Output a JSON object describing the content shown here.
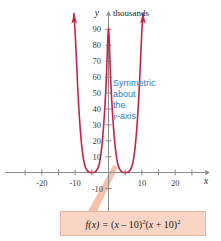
{
  "figure": {
    "name": "polynomial-graph",
    "colors": {
      "curve": "#cc2144",
      "axis": "#8a8a8a",
      "note": "#2a7fc9",
      "callout_fill": "#f9d5c5",
      "callout_border": "#e8a98c",
      "leader": "#f6c0aa",
      "background": "#ffffff"
    },
    "y_axis": {
      "unit_label": "thousands",
      "name": "y",
      "ticks": [
        {
          "value": 90,
          "label": "90"
        },
        {
          "value": 80,
          "label": "80"
        },
        {
          "value": 70,
          "label": "70"
        },
        {
          "value": 60,
          "label": "60"
        },
        {
          "value": 50,
          "label": "50"
        },
        {
          "value": 40,
          "label": "40"
        },
        {
          "value": 30,
          "label": "30"
        },
        {
          "value": 20,
          "label": "20"
        },
        {
          "value": 10,
          "label": "10"
        },
        {
          "value": -10,
          "label": "-10"
        }
      ]
    },
    "x_axis": {
      "name": "x",
      "ticks": [
        {
          "value": -25,
          "label": ""
        },
        {
          "value": -20,
          "label": "-20"
        },
        {
          "value": -15,
          "label": ""
        },
        {
          "value": -10,
          "label": "-10"
        },
        {
          "value": -5,
          "label": ""
        },
        {
          "value": 5,
          "label": ""
        },
        {
          "value": 10,
          "label": "10"
        },
        {
          "value": 15,
          "label": ""
        },
        {
          "value": 20,
          "label": "20"
        },
        {
          "value": 25,
          "label": ""
        }
      ]
    },
    "annotation": {
      "lines": [
        "Symmetric",
        "about",
        "the"
      ],
      "last_line_italic": "y",
      "last_line_rest": "-axis"
    },
    "callout": {
      "fn_name": "f",
      "fn_arg": "(x)",
      "equals": "=",
      "factor1_open": "(",
      "factor1_var": "x",
      "factor1_op": " – 10)",
      "factor1_exp": "2",
      "factor2_open": "(",
      "factor2_var": "x",
      "factor2_op": " + 10)",
      "factor2_exp": "2",
      "full_text": "f(x) = (x – 10)2(x + 10)2"
    }
  },
  "chart_data": {
    "type": "line",
    "title": "",
    "xlabel": "x",
    "ylabel": "y",
    "y_unit": "thousands",
    "equation": "f(x) = (x - 10)^2 (x + 10)^2",
    "xlim": [
      -27,
      27
    ],
    "ylim": [
      -15,
      100
    ],
    "grid": false,
    "legend": null,
    "xticks": [
      -20,
      -10,
      10,
      20
    ],
    "yticks": [
      -10,
      10,
      20,
      30,
      40,
      50,
      60,
      70,
      80,
      90
    ],
    "roots": [
      -10,
      10
    ],
    "local_maximum": {
      "x": 0,
      "y": 10
    },
    "annotations": [
      {
        "text": "Symmetric about the y-axis",
        "x": 3,
        "y": 50
      },
      {
        "text": "f(x) = (x - 10)^2(x + 10)^2",
        "x": 8,
        "y": -30
      }
    ],
    "series": [
      {
        "name": "f(x) = (x-10)^2(x+10)^2",
        "x": [
          -20.8,
          -20,
          -19,
          -18,
          -17,
          -16,
          -15,
          -14,
          -13,
          -12,
          -11,
          -10,
          -9,
          -8,
          -7,
          -6,
          -5,
          -4,
          -3,
          -2,
          -1,
          0,
          1,
          2,
          3,
          4,
          5,
          6,
          7,
          8,
          9,
          10,
          11,
          12,
          13,
          14,
          15,
          16,
          17,
          18,
          19,
          20,
          20.8
        ],
        "y": [
          100,
          90.0,
          64.9,
          43.7,
          27.7,
          15.9,
          7.81,
          3.46,
          1.32,
          0.38,
          0.07,
          0,
          0.07,
          0.38,
          1.32,
          3.46,
          7.81,
          15.9,
          27.7,
          43.7,
          64.9,
          100,
          64.9,
          43.7,
          27.7,
          15.9,
          7.81,
          3.46,
          1.32,
          0.38,
          0.07,
          0,
          0.07,
          0.38,
          1.32,
          3.46,
          7.81,
          15.9,
          27.7,
          43.7,
          64.9,
          90.0,
          100
        ],
        "note": "values in thousands; f(x)=(x^2-100)^2/1000"
      }
    ]
  }
}
